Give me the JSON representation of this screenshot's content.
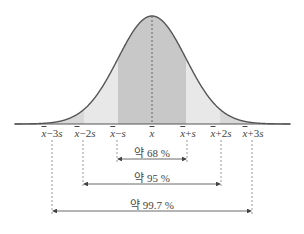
{
  "chart": {
    "mean_x": 152,
    "sd_px": 34,
    "axis_y": 124,
    "peak_y": 16,
    "colors": {
      "inner": "#c8c8c8",
      "middle": "#e8e8e8",
      "outer": "#d8d8d8",
      "curve": "#555555",
      "dash": "#999999",
      "arrow": "#444444"
    }
  },
  "axis_labels": [
    {
      "sym": "x",
      "rest": "−3",
      "s": "s",
      "x": 52
    },
    {
      "sym": "x",
      "rest": "−2",
      "s": "s",
      "x": 85
    },
    {
      "sym": "x",
      "rest": "−",
      "s": "s",
      "x": 118
    },
    {
      "sym": "x",
      "rest": "",
      "s": "",
      "x": 152
    },
    {
      "sym": "x",
      "rest": "+",
      "s": "s",
      "x": 188
    },
    {
      "sym": "x",
      "rest": "+2",
      "s": "s",
      "x": 221
    },
    {
      "sym": "x",
      "rest": "+3",
      "s": "s",
      "x": 253
    }
  ],
  "ranges": [
    {
      "label": "약 68 %",
      "x1": 117,
      "x2": 187,
      "y": 159,
      "label_y": 144
    },
    {
      "label": "약 95 %",
      "x1": 83,
      "x2": 221,
      "y": 184,
      "label_y": 169
    },
    {
      "label": "약 99.7 %",
      "x1": 52,
      "x2": 252,
      "y": 211,
      "label_y": 196
    }
  ],
  "chart_data": {
    "type": "area",
    "title": "",
    "x_ticks": [
      "x̄−3s",
      "x̄−2s",
      "x̄−s",
      "x̄",
      "x̄+s",
      "x̄+2s",
      "x̄+3s"
    ],
    "annotations": [
      {
        "range": [
          "x̄−s",
          "x̄+s"
        ],
        "label": "약 68 %",
        "percent": 68
      },
      {
        "range": [
          "x̄−2s",
          "x̄+2s"
        ],
        "label": "약 95 %",
        "percent": 95
      },
      {
        "range": [
          "x̄−3s",
          "x̄+3s"
        ],
        "label": "약 99.7 %",
        "percent": 99.7
      }
    ]
  }
}
